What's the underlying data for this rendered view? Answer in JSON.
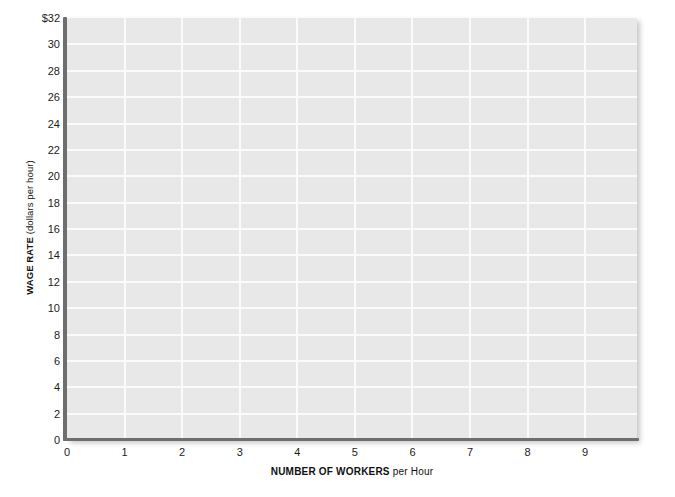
{
  "chart_data": {
    "type": "line",
    "title": "",
    "subtitle": "",
    "xlabel_strong": "NUMBER OF WORKERS",
    "xlabel_plain": " per Hour",
    "ylabel_strong": "WAGE RATE",
    "ylabel_plain": " (dollars per hour)",
    "xlim": [
      0,
      9.9
    ],
    "ylim": [
      0,
      32
    ],
    "x_ticks": [
      {
        "value": 0,
        "label": "0"
      },
      {
        "value": 1,
        "label": "1"
      },
      {
        "value": 2,
        "label": "2"
      },
      {
        "value": 3,
        "label": "3"
      },
      {
        "value": 4,
        "label": "4"
      },
      {
        "value": 5,
        "label": "5"
      },
      {
        "value": 6,
        "label": "6"
      },
      {
        "value": 7,
        "label": "7"
      },
      {
        "value": 8,
        "label": "8"
      },
      {
        "value": 9,
        "label": "9"
      }
    ],
    "y_ticks": [
      {
        "value": 32,
        "label": "$32"
      },
      {
        "value": 30,
        "label": "30"
      },
      {
        "value": 28,
        "label": "28"
      },
      {
        "value": 26,
        "label": "26"
      },
      {
        "value": 24,
        "label": "24"
      },
      {
        "value": 22,
        "label": "22"
      },
      {
        "value": 20,
        "label": "20"
      },
      {
        "value": 18,
        "label": "18"
      },
      {
        "value": 16,
        "label": "16"
      },
      {
        "value": 14,
        "label": "14"
      },
      {
        "value": 12,
        "label": "12"
      },
      {
        "value": 10,
        "label": "10"
      },
      {
        "value": 8,
        "label": "8"
      },
      {
        "value": 6,
        "label": "6"
      },
      {
        "value": 4,
        "label": "4"
      },
      {
        "value": 2,
        "label": "2"
      },
      {
        "value": 0,
        "label": "0"
      }
    ],
    "grid": true,
    "grid_x_step": 1,
    "grid_y_step": 2,
    "legend": [],
    "series": [],
    "annotations": [],
    "plot_background_color": "#e8e8e8",
    "grid_color": "#fbfbfb",
    "axis_color": "#6e6e6e",
    "text_color": "#1c1c1c"
  }
}
